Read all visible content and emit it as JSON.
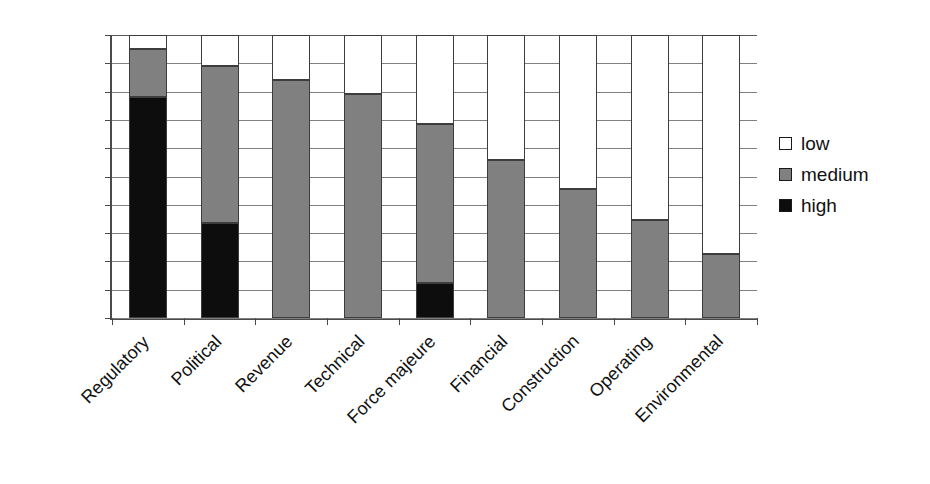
{
  "chart_data": {
    "type": "bar",
    "subtype": "stacked-100-percent",
    "title": "",
    "xlabel": "",
    "ylabel": "",
    "ylim": [
      0,
      100
    ],
    "ytick_labels": [
      "100%",
      "90%",
      "80%",
      "70%",
      "60%",
      "50%",
      "40%",
      "30%",
      "20%",
      "10%",
      "0%"
    ],
    "ytick_values": [
      100,
      90,
      80,
      70,
      60,
      50,
      40,
      30,
      20,
      10,
      0
    ],
    "grid": true,
    "legend_position": "right",
    "categories": [
      "Regulatory",
      "Political",
      "Revenue",
      "Technical",
      "Force majeure",
      "Financial",
      "Construction",
      "Operating",
      "Environmental"
    ],
    "series": [
      {
        "name": "high",
        "color": "#0d0d0d",
        "values": [
          78,
          33.5,
          0,
          0,
          12.5,
          0,
          0,
          0,
          0
        ]
      },
      {
        "name": "medium",
        "color": "#808080",
        "values": [
          17,
          55.5,
          84,
          79,
          56,
          56,
          45.5,
          34.5,
          22.5
        ]
      },
      {
        "name": "low",
        "color": "#ffffff",
        "values": [
          5,
          11,
          16,
          21,
          31.5,
          44,
          54.5,
          65.5,
          77.5
        ]
      }
    ],
    "stack_tops": {
      "high": [
        78,
        33.5,
        0,
        0,
        12.5,
        0,
        0,
        0,
        0
      ],
      "medium": [
        95,
        89,
        84,
        79,
        68.5,
        56,
        45.5,
        34.5,
        22.5
      ],
      "low": [
        100,
        100,
        100,
        100,
        100,
        100,
        100,
        100,
        100
      ]
    }
  },
  "legend": {
    "items": [
      {
        "label": "low",
        "key": "low"
      },
      {
        "label": "medium",
        "key": "medium"
      },
      {
        "label": "high",
        "key": "high"
      }
    ]
  }
}
